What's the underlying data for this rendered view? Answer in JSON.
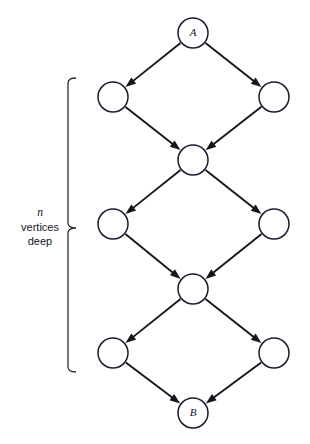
{
  "diagram": {
    "background_color": "#ffffff",
    "stroke_color": "#15151f",
    "node_fill": "#ffffff",
    "nodes": [
      {
        "id": "A",
        "label": "A",
        "cx": 193,
        "cy": 33,
        "r": 15,
        "has_label": true
      },
      {
        "id": "L1",
        "label": "",
        "cx": 113,
        "cy": 97,
        "r": 15,
        "has_label": false
      },
      {
        "id": "R1",
        "label": "",
        "cx": 274,
        "cy": 97,
        "r": 15,
        "has_label": false
      },
      {
        "id": "M1",
        "label": "",
        "cx": 193,
        "cy": 160,
        "r": 15,
        "has_label": false
      },
      {
        "id": "L2",
        "label": "",
        "cx": 113,
        "cy": 224,
        "r": 15,
        "has_label": false
      },
      {
        "id": "R2",
        "label": "",
        "cx": 274,
        "cy": 224,
        "r": 15,
        "has_label": false
      },
      {
        "id": "M2",
        "label": "",
        "cx": 193,
        "cy": 289,
        "r": 15,
        "has_label": false
      },
      {
        "id": "L3",
        "label": "",
        "cx": 113,
        "cy": 353,
        "r": 15,
        "has_label": false
      },
      {
        "id": "R3",
        "label": "",
        "cx": 274,
        "cy": 353,
        "r": 15,
        "has_label": false
      },
      {
        "id": "B",
        "label": "B",
        "cx": 193,
        "cy": 413,
        "r": 15,
        "has_label": true
      }
    ],
    "edges": [
      {
        "from": "A",
        "to": "L1",
        "directed": true
      },
      {
        "from": "A",
        "to": "R1",
        "directed": true
      },
      {
        "from": "L1",
        "to": "M1",
        "directed": true
      },
      {
        "from": "R1",
        "to": "M1",
        "directed": true
      },
      {
        "from": "M1",
        "to": "L2",
        "directed": true
      },
      {
        "from": "M1",
        "to": "R2",
        "directed": true
      },
      {
        "from": "L2",
        "to": "M2",
        "directed": true
      },
      {
        "from": "R2",
        "to": "M2",
        "directed": true
      },
      {
        "from": "M2",
        "to": "L3",
        "directed": true
      },
      {
        "from": "M2",
        "to": "R3",
        "directed": true
      },
      {
        "from": "L3",
        "to": "B",
        "directed": true
      },
      {
        "from": "R3",
        "to": "B",
        "directed": true
      }
    ],
    "annotation": {
      "variable": "n",
      "line2": "vertices",
      "line3": "deep",
      "brace": {
        "orientation": "right-pointing",
        "top_y": 78,
        "bottom_y": 372,
        "mid_y": 228,
        "spine_x": 68,
        "tip_x": 76
      }
    }
  }
}
